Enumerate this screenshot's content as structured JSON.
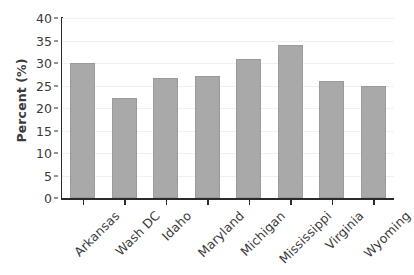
{
  "chart_data": {
    "type": "bar",
    "title": "",
    "xlabel": "",
    "ylabel": "Percent (%)",
    "categories": [
      "Arkansas",
      "Wash DC",
      "Idaho",
      "Maryland",
      "Michigan",
      "Mississippi",
      "Virginia",
      "Wyoming"
    ],
    "values": [
      30.0,
      22.2,
      26.6,
      27.1,
      31.0,
      34.0,
      26.0,
      25.0
    ],
    "ylim": [
      0,
      40
    ],
    "yticks": [
      0,
      5,
      10,
      15,
      20,
      25,
      30,
      35,
      40
    ],
    "ytick_labels": [
      "0",
      "5",
      "10",
      "15",
      "20",
      "25",
      "30",
      "35",
      "40"
    ],
    "grid": true,
    "grid_axis": "y",
    "legend": false,
    "legend_position": "none",
    "bar_color": "#a9a9a9",
    "bar_edge_color": "#9a9a9a",
    "background_color": "#ffffff",
    "axis_color": "#2b2b2b",
    "grid_color": "#f0f0f0",
    "text_color": "#3a3a3a",
    "xtick_label_rotation": -45
  }
}
